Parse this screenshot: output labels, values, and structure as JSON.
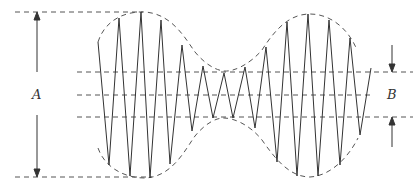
{
  "diagram": {
    "labels": {
      "A": "A",
      "B": "B"
    },
    "colors": {
      "line": "#333333",
      "dashed": "#555555",
      "background": "#ffffff"
    }
  }
}
